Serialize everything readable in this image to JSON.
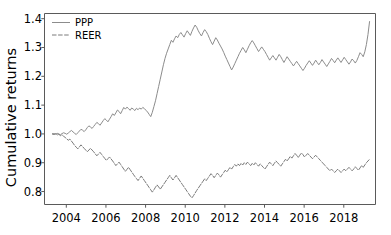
{
  "chart_data": {
    "type": "line",
    "title": "",
    "xlabel": "",
    "ylabel": "Cumulative returns",
    "xlim": [
      2002.9,
      2019.6
    ],
    "ylim": [
      0.755,
      1.418
    ],
    "grid": false,
    "legend_position": "upper left",
    "xticks": [
      2004,
      2006,
      2008,
      2010,
      2012,
      2014,
      2016,
      2018
    ],
    "xtick_labels": [
      "2004",
      "2006",
      "2008",
      "2010",
      "2012",
      "2014",
      "2016",
      "2018"
    ],
    "yticks": [
      0.8,
      0.9,
      1.0,
      1.1,
      1.2,
      1.3,
      1.4
    ],
    "ytick_labels": [
      "0.8",
      "0.9",
      "1.0",
      "1.1",
      "1.2",
      "1.3",
      "1.4"
    ],
    "colors": {
      "ppp": "#8c8c8c",
      "reer": "#7a7a7a",
      "axis": "#5a5a5a",
      "text": "#000000",
      "background": "#ffffff"
    },
    "series": [
      {
        "name": "PPP",
        "linestyle": "solid",
        "color": "#8c8c8c",
        "x": [
          2003.3,
          2003.38,
          2003.46,
          2003.54,
          2003.62,
          2003.7,
          2003.78,
          2003.86,
          2003.94,
          2004.02,
          2004.1,
          2004.18,
          2004.26,
          2004.34,
          2004.42,
          2004.5,
          2004.58,
          2004.66,
          2004.74,
          2004.82,
          2004.9,
          2004.98,
          2005.06,
          2005.14,
          2005.22,
          2005.3,
          2005.38,
          2005.46,
          2005.54,
          2005.62,
          2005.7,
          2005.78,
          2005.86,
          2005.94,
          2006.02,
          2006.1,
          2006.18,
          2006.26,
          2006.34,
          2006.42,
          2006.5,
          2006.58,
          2006.66,
          2006.74,
          2006.82,
          2006.9,
          2006.98,
          2007.06,
          2007.14,
          2007.22,
          2007.3,
          2007.38,
          2007.46,
          2007.54,
          2007.62,
          2007.7,
          2007.78,
          2007.86,
          2007.94,
          2008.02,
          2008.1,
          2008.18,
          2008.26,
          2008.34,
          2008.42,
          2008.5,
          2008.58,
          2008.66,
          2008.74,
          2008.82,
          2008.9,
          2008.98,
          2009.06,
          2009.14,
          2009.22,
          2009.3,
          2009.38,
          2009.46,
          2009.54,
          2009.62,
          2009.7,
          2009.78,
          2009.86,
          2009.94,
          2010.02,
          2010.1,
          2010.18,
          2010.26,
          2010.34,
          2010.42,
          2010.5,
          2010.58,
          2010.66,
          2010.74,
          2010.82,
          2010.9,
          2010.98,
          2011.06,
          2011.14,
          2011.22,
          2011.3,
          2011.38,
          2011.46,
          2011.54,
          2011.62,
          2011.7,
          2011.78,
          2011.86,
          2011.94,
          2012.02,
          2012.1,
          2012.18,
          2012.26,
          2012.34,
          2012.42,
          2012.5,
          2012.58,
          2012.66,
          2012.74,
          2012.82,
          2012.9,
          2012.98,
          2013.06,
          2013.14,
          2013.22,
          2013.3,
          2013.38,
          2013.46,
          2013.54,
          2013.62,
          2013.7,
          2013.78,
          2013.86,
          2013.94,
          2014.02,
          2014.1,
          2014.18,
          2014.26,
          2014.34,
          2014.42,
          2014.5,
          2014.58,
          2014.66,
          2014.74,
          2014.82,
          2014.9,
          2014.98,
          2015.06,
          2015.14,
          2015.22,
          2015.3,
          2015.38,
          2015.46,
          2015.54,
          2015.62,
          2015.7,
          2015.78,
          2015.86,
          2015.94,
          2016.02,
          2016.1,
          2016.18,
          2016.26,
          2016.34,
          2016.42,
          2016.5,
          2016.58,
          2016.66,
          2016.74,
          2016.82,
          2016.9,
          2016.98,
          2017.06,
          2017.14,
          2017.22,
          2017.3,
          2017.38,
          2017.46,
          2017.54,
          2017.62,
          2017.7,
          2017.78,
          2017.86,
          2017.94,
          2018.02,
          2018.1,
          2018.18,
          2018.26,
          2018.34,
          2018.42,
          2018.5,
          2018.58,
          2018.66,
          2018.74,
          2018.82,
          2018.9,
          2018.98,
          2019.06,
          2019.14,
          2019.22,
          2019.3
        ],
        "y": [
          1.0,
          1.001,
          0.999,
          1.002,
          1.0,
          0.997,
          1.001,
          1.004,
          1.002,
          0.999,
          1.003,
          1.008,
          1.012,
          1.007,
          1.002,
          0.998,
          1.004,
          1.01,
          1.016,
          1.013,
          1.008,
          1.014,
          1.022,
          1.028,
          1.024,
          1.019,
          1.026,
          1.033,
          1.04,
          1.036,
          1.03,
          1.038,
          1.046,
          1.053,
          1.048,
          1.042,
          1.051,
          1.06,
          1.07,
          1.064,
          1.073,
          1.083,
          1.078,
          1.07,
          1.081,
          1.092,
          1.086,
          1.093,
          1.088,
          1.082,
          1.09,
          1.086,
          1.081,
          1.089,
          1.084,
          1.09,
          1.086,
          1.092,
          1.088,
          1.082,
          1.076,
          1.068,
          1.06,
          1.075,
          1.095,
          1.115,
          1.14,
          1.165,
          1.19,
          1.215,
          1.24,
          1.262,
          1.28,
          1.295,
          1.31,
          1.325,
          1.318,
          1.33,
          1.34,
          1.334,
          1.345,
          1.352,
          1.344,
          1.336,
          1.348,
          1.358,
          1.35,
          1.342,
          1.356,
          1.368,
          1.378,
          1.37,
          1.358,
          1.348,
          1.34,
          1.352,
          1.362,
          1.355,
          1.345,
          1.332,
          1.32,
          1.31,
          1.322,
          1.334,
          1.326,
          1.315,
          1.305,
          1.295,
          1.283,
          1.27,
          1.258,
          1.246,
          1.234,
          1.222,
          1.232,
          1.244,
          1.256,
          1.268,
          1.28,
          1.29,
          1.3,
          1.292,
          1.282,
          1.294,
          1.306,
          1.316,
          1.324,
          1.316,
          1.306,
          1.296,
          1.286,
          1.294,
          1.302,
          1.294,
          1.286,
          1.276,
          1.266,
          1.256,
          1.264,
          1.272,
          1.264,
          1.256,
          1.266,
          1.276,
          1.268,
          1.258,
          1.248,
          1.258,
          1.268,
          1.26,
          1.252,
          1.244,
          1.236,
          1.244,
          1.252,
          1.244,
          1.236,
          1.228,
          1.22,
          1.228,
          1.238,
          1.246,
          1.254,
          1.246,
          1.238,
          1.246,
          1.256,
          1.248,
          1.24,
          1.248,
          1.258,
          1.25,
          1.242,
          1.234,
          1.243,
          1.252,
          1.262,
          1.255,
          1.247,
          1.256,
          1.264,
          1.256,
          1.248,
          1.257,
          1.266,
          1.258,
          1.25,
          1.242,
          1.25,
          1.26,
          1.254,
          1.246,
          1.255,
          1.268,
          1.282,
          1.276,
          1.268,
          1.285,
          1.31,
          1.345,
          1.39
        ]
      },
      {
        "name": "REER",
        "linestyle": "dashed",
        "color": "#7a7a7a",
        "x": [
          2003.3,
          2003.38,
          2003.46,
          2003.54,
          2003.62,
          2003.7,
          2003.78,
          2003.86,
          2003.94,
          2004.02,
          2004.1,
          2004.18,
          2004.26,
          2004.34,
          2004.42,
          2004.5,
          2004.58,
          2004.66,
          2004.74,
          2004.82,
          2004.9,
          2004.98,
          2005.06,
          2005.14,
          2005.22,
          2005.3,
          2005.38,
          2005.46,
          2005.54,
          2005.62,
          2005.7,
          2005.78,
          2005.86,
          2005.94,
          2006.02,
          2006.1,
          2006.18,
          2006.26,
          2006.34,
          2006.42,
          2006.5,
          2006.58,
          2006.66,
          2006.74,
          2006.82,
          2006.9,
          2006.98,
          2007.06,
          2007.14,
          2007.22,
          2007.3,
          2007.38,
          2007.46,
          2007.54,
          2007.62,
          2007.7,
          2007.78,
          2007.86,
          2007.94,
          2008.02,
          2008.1,
          2008.18,
          2008.26,
          2008.34,
          2008.42,
          2008.5,
          2008.58,
          2008.66,
          2008.74,
          2008.82,
          2008.9,
          2008.98,
          2009.06,
          2009.14,
          2009.22,
          2009.3,
          2009.38,
          2009.46,
          2009.54,
          2009.62,
          2009.7,
          2009.78,
          2009.86,
          2009.94,
          2010.02,
          2010.1,
          2010.18,
          2010.26,
          2010.34,
          2010.42,
          2010.5,
          2010.58,
          2010.66,
          2010.74,
          2010.82,
          2010.9,
          2010.98,
          2011.06,
          2011.14,
          2011.22,
          2011.3,
          2011.38,
          2011.46,
          2011.54,
          2011.62,
          2011.7,
          2011.78,
          2011.86,
          2011.94,
          2012.02,
          2012.1,
          2012.18,
          2012.26,
          2012.34,
          2012.42,
          2012.5,
          2012.58,
          2012.66,
          2012.74,
          2012.82,
          2012.9,
          2012.98,
          2013.06,
          2013.14,
          2013.22,
          2013.3,
          2013.38,
          2013.46,
          2013.54,
          2013.62,
          2013.7,
          2013.78,
          2013.86,
          2013.94,
          2014.02,
          2014.1,
          2014.18,
          2014.26,
          2014.34,
          2014.42,
          2014.5,
          2014.58,
          2014.66,
          2014.74,
          2014.82,
          2014.9,
          2014.98,
          2015.06,
          2015.14,
          2015.22,
          2015.3,
          2015.38,
          2015.46,
          2015.54,
          2015.62,
          2015.7,
          2015.78,
          2015.86,
          2015.94,
          2016.02,
          2016.1,
          2016.18,
          2016.26,
          2016.34,
          2016.42,
          2016.5,
          2016.58,
          2016.66,
          2016.74,
          2016.82,
          2016.9,
          2016.98,
          2017.06,
          2017.14,
          2017.22,
          2017.3,
          2017.38,
          2017.46,
          2017.54,
          2017.62,
          2017.7,
          2017.78,
          2017.86,
          2017.94,
          2018.02,
          2018.1,
          2018.18,
          2018.26,
          2018.34,
          2018.42,
          2018.5,
          2018.58,
          2018.66,
          2018.74,
          2018.82,
          2018.9,
          2018.98,
          2019.06,
          2019.14,
          2019.22,
          2019.3
        ],
        "y": [
          1.0,
          0.998,
          1.001,
          0.996,
          0.999,
          0.994,
          0.997,
          0.992,
          0.988,
          0.983,
          0.978,
          0.982,
          0.975,
          0.968,
          0.96,
          0.954,
          0.948,
          0.955,
          0.962,
          0.956,
          0.95,
          0.944,
          0.938,
          0.944,
          0.95,
          0.944,
          0.938,
          0.931,
          0.924,
          0.93,
          0.936,
          0.929,
          0.922,
          0.915,
          0.908,
          0.914,
          0.92,
          0.913,
          0.906,
          0.898,
          0.89,
          0.896,
          0.902,
          0.894,
          0.886,
          0.878,
          0.87,
          0.877,
          0.884,
          0.876,
          0.868,
          0.86,
          0.852,
          0.845,
          0.838,
          0.846,
          0.854,
          0.846,
          0.838,
          0.83,
          0.822,
          0.814,
          0.806,
          0.798,
          0.806,
          0.815,
          0.823,
          0.816,
          0.808,
          0.816,
          0.824,
          0.832,
          0.84,
          0.848,
          0.856,
          0.848,
          0.84,
          0.848,
          0.856,
          0.848,
          0.84,
          0.832,
          0.824,
          0.816,
          0.808,
          0.8,
          0.792,
          0.784,
          0.778,
          0.786,
          0.795,
          0.804,
          0.812,
          0.82,
          0.828,
          0.836,
          0.844,
          0.838,
          0.846,
          0.854,
          0.862,
          0.856,
          0.848,
          0.856,
          0.864,
          0.858,
          0.85,
          0.858,
          0.866,
          0.874,
          0.868,
          0.876,
          0.884,
          0.878,
          0.886,
          0.894,
          0.888,
          0.896,
          0.89,
          0.898,
          0.892,
          0.9,
          0.894,
          0.902,
          0.896,
          0.89,
          0.898,
          0.892,
          0.9,
          0.894,
          0.888,
          0.896,
          0.89,
          0.884,
          0.878,
          0.886,
          0.894,
          0.902,
          0.896,
          0.89,
          0.898,
          0.906,
          0.9,
          0.894,
          0.888,
          0.896,
          0.904,
          0.912,
          0.906,
          0.914,
          0.922,
          0.916,
          0.924,
          0.932,
          0.926,
          0.918,
          0.926,
          0.934,
          0.928,
          0.92,
          0.926,
          0.932,
          0.926,
          0.92,
          0.914,
          0.92,
          0.926,
          0.92,
          0.914,
          0.908,
          0.902,
          0.896,
          0.89,
          0.884,
          0.878,
          0.872,
          0.878,
          0.872,
          0.866,
          0.872,
          0.878,
          0.872,
          0.866,
          0.872,
          0.878,
          0.872,
          0.878,
          0.884,
          0.878,
          0.872,
          0.878,
          0.886,
          0.88,
          0.874,
          0.882,
          0.89,
          0.884,
          0.892,
          0.9,
          0.906,
          0.912
        ]
      }
    ]
  },
  "legend": {
    "entries": [
      {
        "label": "PPP",
        "style": "solid"
      },
      {
        "label": "REER",
        "style": "dashed"
      }
    ]
  }
}
